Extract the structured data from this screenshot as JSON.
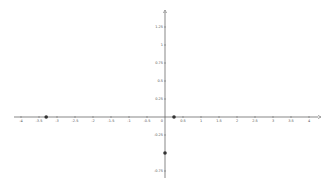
{
  "chart_data": {
    "type": "scatter",
    "title": "",
    "xlabel": "",
    "ylabel": "",
    "xlim": [
      -4.2,
      4.3
    ],
    "ylim": [
      -0.8,
      1.5
    ],
    "grid": false,
    "x_ticks": [
      -4,
      -3.5,
      -3,
      -2.5,
      -2,
      -1.5,
      -1,
      -0.5,
      0.5,
      1,
      1.5,
      2,
      2.5,
      3,
      3.5,
      4
    ],
    "y_ticks": [
      1.25,
      1,
      0.75,
      0.5,
      0.25,
      -0.25,
      -0.75
    ],
    "origin_label": "0",
    "series": [
      {
        "name": "points",
        "x": [
          -3.3,
          0.25,
          0
        ],
        "y": [
          0,
          0,
          -0.5
        ]
      }
    ]
  },
  "colors": {
    "axis": "#555555",
    "point": "#333333",
    "label": "#666666"
  }
}
